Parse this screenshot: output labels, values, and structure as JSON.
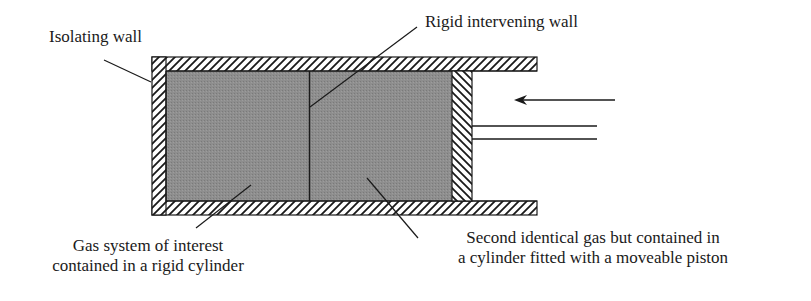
{
  "diagram": {
    "labels": {
      "isolating_wall": "Isolating wall",
      "rigid_intervening_wall": "Rigid intervening wall",
      "gas_system_line1": "Gas system of interest",
      "gas_system_line2": "contained in a rigid cylinder",
      "second_gas_line1": "Second identical gas but contained in",
      "second_gas_line2": "a cylinder fitted with a moveable piston"
    },
    "colors": {
      "gas_fill": "#8c8c8c",
      "wall_stroke": "#1a1a1a",
      "background": "#ffffff"
    },
    "arrow": {
      "direction": "left",
      "meaning": "force on piston"
    }
  }
}
